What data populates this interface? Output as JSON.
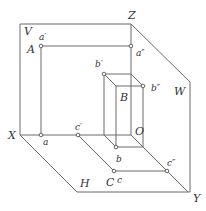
{
  "diagram": {
    "type": "three-plane projection (orthographic)",
    "planes": {
      "V": "V",
      "H": "H",
      "W": "W"
    },
    "axes": {
      "X": "X",
      "Y": "Y",
      "Z": "Z",
      "O": "O"
    },
    "points": {
      "A": "A",
      "a_prime": "a′",
      "a_double": "a″",
      "a": "a",
      "B": "B",
      "b_prime": "b′",
      "b_double": "b″",
      "b": "b",
      "C": "C",
      "c_prime": "c′",
      "c_double": "c″",
      "c": "c"
    },
    "colors": {
      "line": "#6a6a6a",
      "text": "#333333",
      "background": "#ffffff"
    }
  }
}
